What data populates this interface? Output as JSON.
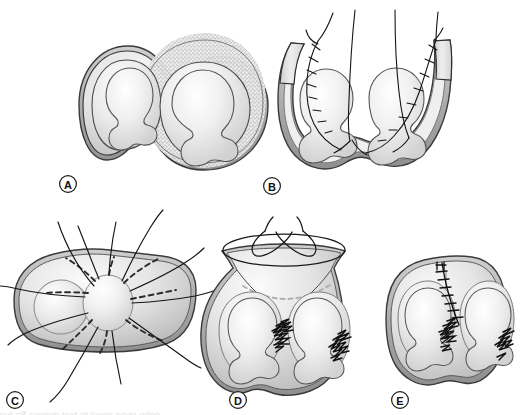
{
  "figure": {
    "type": "medical-line-illustration",
    "panel_count": 5,
    "background_color": "#ffffff",
    "ink_color": "#1a1a1a",
    "wall_fill_light": "#f2f2f2",
    "wall_fill_mid": "#d6d6d6",
    "wall_fill_dark": "#a8a8a8",
    "lumen_fill": "#ededed",
    "stipple_color": "#9a9a9a",
    "suture_color": "#141414",
    "dashed_line_color": "#2b2b2b",
    "caption_sliver": "cut-off caption text at lower page edge"
  },
  "panels": [
    {
      "id": "A",
      "label": "A",
      "label_x": 68,
      "label_y": 184,
      "description": "Two fused sacs side by side, right sac wall shown with dense stippled texture, each containing an internal body with a rounded head and lobed base.",
      "features": [
        "left-sac",
        "right-sac",
        "fusion-isthmus",
        "stippled-wall",
        "inner-body-left",
        "inner-body-right"
      ]
    },
    {
      "id": "B",
      "label": "B",
      "label_x": 272,
      "label_y": 186,
      "description": "Opened U-shaped cavity with both walls reflected upward; running whip sutures along both cut edges with long free tails rising off the top of the field.",
      "features": [
        "reflected-left-flap",
        "reflected-right-flap",
        "running-whip-suture-left",
        "running-whip-suture-right",
        "free-suture-tails",
        "inner-body-left",
        "inner-body-right"
      ]
    },
    {
      "id": "C",
      "label": "C",
      "label_x": 15,
      "label_y": 400,
      "description": "Transverse view showing a central oval hub with eight radiating dashed planned incision lines and solid suture strands passing out beyond the wall.",
      "features": [
        "central-hub-oval",
        "radial-dashed-lines",
        "radiating-sutures",
        "left-lumen-oval",
        "outer-wall"
      ]
    },
    {
      "id": "D",
      "label": "D",
      "label_x": 238,
      "label_y": 400,
      "description": "Sac drawn upward into a neck, tied with a crossed bow knot at the apex; dashed arc marks the resection line and two dense zigzag suture clusters secure the medial walls.",
      "features": [
        "apex-bow-knot",
        "drawn-neck",
        "dashed-resection-arc",
        "zigzag-suture-cluster-medial",
        "zigzag-suture-cluster-lateral",
        "inner-body-left",
        "inner-body-right"
      ]
    },
    {
      "id": "E",
      "label": "E",
      "label_x": 400,
      "label_y": 400,
      "description": "Completed closure: a ladder of interrupted sutures runs from the top wall down the midline septum, with zigzag suture clusters at the medial and lateral margins.",
      "features": [
        "interrupted-suture-ladder",
        "closed-wall",
        "midline-septum",
        "zigzag-suture-cluster-medial",
        "zigzag-suture-cluster-lateral",
        "inner-body-left",
        "inner-body-right"
      ]
    }
  ],
  "labels": {
    "a": "A",
    "b": "B",
    "c": "C",
    "d": "D",
    "e": "E"
  }
}
